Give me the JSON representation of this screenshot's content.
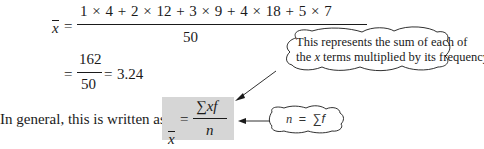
{
  "equation1": {
    "lhs_symbol": "x",
    "equals": "=",
    "numerator": "1 × 4 + 2 × 12 + 3 × 9 + 4 × 18 + 5 × 7",
    "denominator": "50"
  },
  "equation2": {
    "equals1": "=",
    "numerator": "162",
    "denominator": "50",
    "equals2": "=",
    "result": "3.24"
  },
  "general": {
    "intro_text": "In general, this is written as",
    "lhs_symbol": "x",
    "equals": "=",
    "numerator": "∑xf",
    "denominator": "n",
    "box_color": "#d6d6d6"
  },
  "callout_top": {
    "line1": "This represents the sum of each of",
    "line2_prefix": "the ",
    "line2_var": "x",
    "line2_suffix": " terms multiplied by its frequency"
  },
  "callout_bottom": {
    "var": "n",
    "equals": "=",
    "expr": "∑f"
  }
}
